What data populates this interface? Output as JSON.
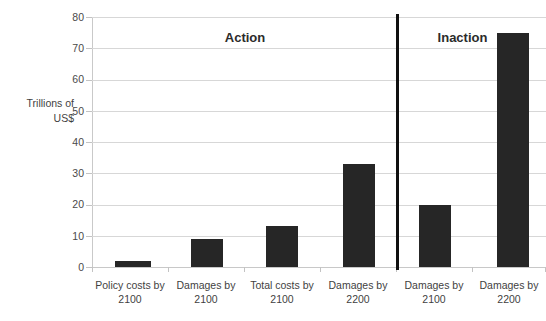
{
  "chart_data": {
    "type": "bar",
    "title": "",
    "cropped_title_remnant": "",
    "xlabel": "",
    "ylabel": "Trillions of US$",
    "ylabel_lines": [
      "Trillions of",
      "US$"
    ],
    "ylim": [
      0,
      80
    ],
    "ytick_step": 10,
    "yticks": [
      80,
      70,
      60,
      50,
      40,
      30,
      20,
      10,
      0
    ],
    "grid": true,
    "legend": "none",
    "categories": [
      "Policy costs by 2100",
      "Damages by 2100",
      "Total costs by 2100",
      "Damages by 2200",
      "Damages by 2100",
      "Damages by 2200"
    ],
    "category_lines": [
      [
        "Policy costs by",
        "2100"
      ],
      [
        "Damages by",
        "2100"
      ],
      [
        "Total costs by",
        "2100"
      ],
      [
        "Damages by",
        "2200"
      ],
      [
        "Damages by",
        "2100"
      ],
      [
        "Damages by",
        "2200"
      ]
    ],
    "values": [
      2,
      9,
      13,
      33,
      20,
      75
    ],
    "bar_color": "#262626",
    "groups": [
      {
        "label": "Action",
        "categories": [
          0,
          1,
          2,
          3
        ]
      },
      {
        "label": "Inaction",
        "categories": [
          4,
          5
        ]
      }
    ],
    "divider_after_category_index": 3,
    "divider_color": "#101010"
  },
  "annotations": {
    "section_action": "Action",
    "section_inaction": "Inaction"
  }
}
